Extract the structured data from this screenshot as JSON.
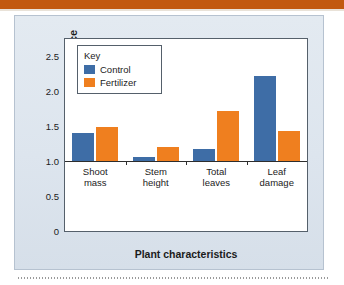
{
  "page": {
    "top_rule_color": "#c2590f",
    "panel_bg_color": "#dde5ee"
  },
  "chart_data": {
    "type": "bar",
    "title": "",
    "xlabel": "Plant characteristics",
    "ylabel": "Relative performance",
    "categories": [
      "Shoot mass",
      "Stem height",
      "Total leaves",
      "Leaf damage"
    ],
    "category_lines": [
      [
        "Shoot",
        "mass"
      ],
      [
        "Stem",
        "height"
      ],
      [
        "Total",
        "leaves"
      ],
      [
        "Leaf",
        "damage"
      ]
    ],
    "series": [
      {
        "name": "Control",
        "color": "#3e6da6",
        "values": [
          1.41,
          1.06,
          1.17,
          2.22
        ]
      },
      {
        "name": "Fertilizer",
        "color": "#ef7f1f",
        "values": [
          1.49,
          1.21,
          1.72,
          1.43
        ]
      }
    ],
    "ylim": [
      0,
      2.75
    ],
    "baseline": 1.0,
    "yticks": [
      0,
      0.5,
      1.0,
      1.5,
      2.0,
      2.5
    ],
    "ytick_labels": [
      "0",
      "0.5",
      "1.0",
      "1.5",
      "2.0",
      "2.5"
    ],
    "grid": false,
    "legend_position": "upper-left",
    "legend_title": "Key"
  }
}
